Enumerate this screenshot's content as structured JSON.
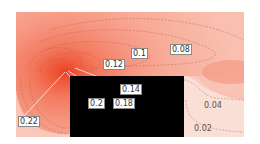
{
  "chart_data": {
    "type": "contour",
    "title": "",
    "xlabel": "",
    "ylabel": "",
    "colormap": [
      "#fbe3dc",
      "#f9cabd",
      "#f7b09e",
      "#f59680",
      "#f37c62",
      "#f06246",
      "#ee4a2c"
    ],
    "obstacle_color": "#000000",
    "levels": [
      0.02,
      0.04,
      0.08,
      0.1,
      0.12,
      0.14,
      0.18,
      0.2,
      0.22
    ],
    "contour_labels": [
      {
        "value": "0.22",
        "x": 18,
        "y": 116
      },
      {
        "value": "0.2",
        "x": 88,
        "y": 98
      },
      {
        "value": "0.18",
        "x": 113,
        "y": 98
      },
      {
        "value": "0.14",
        "x": 120,
        "y": 84
      },
      {
        "value": "0.12",
        "x": 103,
        "y": 59
      },
      {
        "value": "0.1",
        "x": 131,
        "y": 48
      },
      {
        "value": "0.08",
        "x": 170,
        "y": 44
      },
      {
        "value": "0.04",
        "x": 203,
        "y": 101
      },
      {
        "value": "0.02",
        "x": 193,
        "y": 124
      }
    ],
    "peak": {
      "x": 65,
      "y": 72
    },
    "domain_box": {
      "x0": 16,
      "y0": 12,
      "x1": 244,
      "y1": 137
    },
    "obstacle_box": {
      "x0": 70,
      "y0": 76,
      "x1": 184,
      "y1": 137
    }
  }
}
